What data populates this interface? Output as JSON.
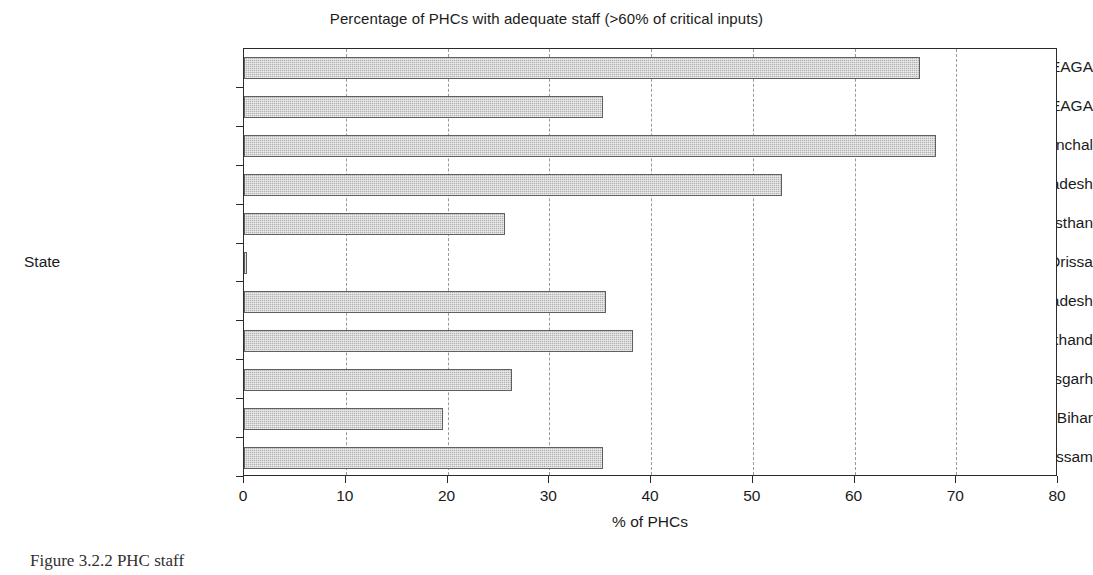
{
  "chart_data": {
    "type": "bar",
    "orientation": "horizontal",
    "title": "Percentage of PHCs with adequate staff (>60% of critical inputs)",
    "xlabel": "% of PHCs",
    "ylabel": "State",
    "xlim": [
      0,
      80
    ],
    "xticks": [
      "0",
      "10",
      "20",
      "30",
      "40",
      "50",
      "60",
      "70",
      "80"
    ],
    "grid": "vertical-dashed",
    "legend": "none",
    "bar_color": "#b3b3b3",
    "bar_border_color": "#606060",
    "categories": [
      "non-EAGA",
      "EAGA",
      "Uttaranchal",
      "Uttar Pradesh",
      "Rajasthan",
      "Orissa",
      "Madhya Pradesh",
      "Jharkhand",
      "Chhatisgarh",
      "Bihar",
      "Assam"
    ],
    "values": [
      66.4,
      35.3,
      68.0,
      52.9,
      25.7,
      0.3,
      35.6,
      38.2,
      26.3,
      19.6,
      35.3
    ]
  },
  "caption": {
    "text": "Figure 3.2.2  PHC staff"
  }
}
